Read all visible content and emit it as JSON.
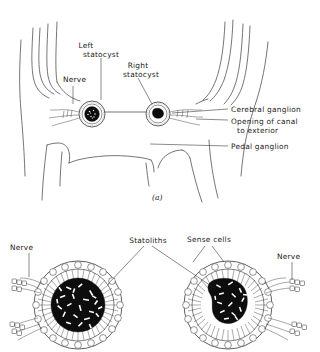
{
  "figure": {
    "caption_a": "(a)",
    "panel_a": {
      "labels": [
        {
          "id": "nerve",
          "text": "Nerve",
          "lines": [
            "Nerve"
          ]
        },
        {
          "id": "left-statocyst",
          "text": "Left statocyst",
          "lines": [
            "Left",
            "statocyst"
          ]
        },
        {
          "id": "right-statocyst",
          "text": "Right statocyst",
          "lines": [
            "Right",
            "statocyst"
          ]
        },
        {
          "id": "cerebral-ganglion",
          "text": "Cerebral ganglion",
          "lines": [
            "Cerebral ganglion"
          ]
        },
        {
          "id": "opening-of-canal",
          "text": "Opening of canal to exterior",
          "lines": [
            "Opening of canal",
            "to exterior"
          ]
        },
        {
          "id": "pedal-ganglion",
          "text": "Pedal ganglion",
          "lines": [
            "Pedal ganglion"
          ]
        }
      ]
    },
    "panel_b": {
      "labels": [
        {
          "id": "nerve-left",
          "text": "Nerve",
          "lines": [
            "Nerve"
          ]
        },
        {
          "id": "statoliths",
          "text": "Statoliths",
          "lines": [
            "Statoliths"
          ]
        },
        {
          "id": "sense-cells",
          "text": "Sense cells",
          "lines": [
            "Sense cells"
          ]
        },
        {
          "id": "nerve-right",
          "text": "Nerve",
          "lines": [
            "Nerve"
          ]
        }
      ]
    }
  },
  "colors": {
    "background": "#ffffff",
    "ink": "#1a1a1a",
    "line": "#3a3a3a",
    "statolith_fill": "#0d0d0d"
  }
}
